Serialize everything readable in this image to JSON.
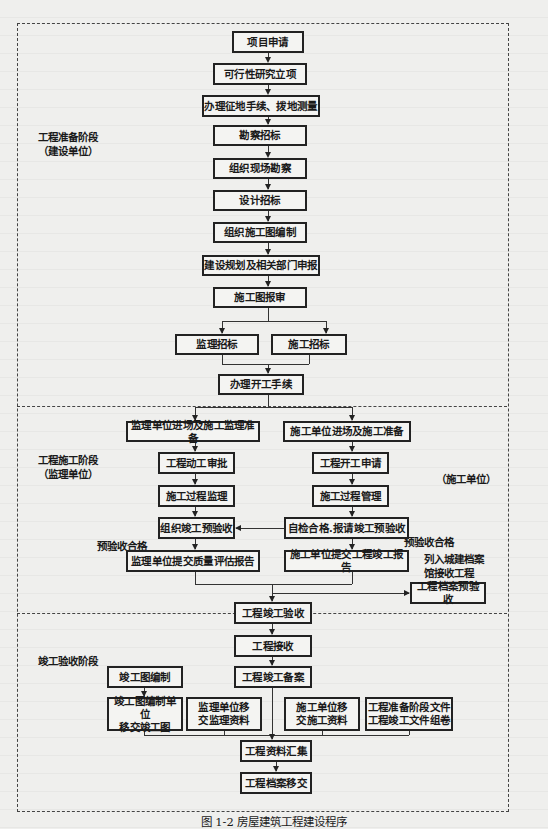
{
  "caption": "图 1-2   房屋建筑工程建设程序",
  "stages": {
    "prep": {
      "label": "工程准备阶段\n（建设单位）"
    },
    "construction": {
      "label": "工程施工阶段\n（监理单位）",
      "right_label": "（施工单位）"
    },
    "acceptance": {
      "label": "竣工验收阶段"
    }
  },
  "annotations": {
    "pre_accept_left": "预验收合格",
    "pre_accept_right": "预验收合格",
    "archive_note": "列入城建档案\n馆接收工程"
  },
  "nodes": {
    "n1": "项目申请",
    "n2": "可行性研究立项",
    "n3": "办理征地手续、拨地测量",
    "n4": "勘察招标",
    "n5": "组织现场勘察",
    "n6": "设计招标",
    "n7": "组织施工图编制",
    "n8": "建设规划及相关部门申报",
    "n9": "施工图报审",
    "n10": "监理招标",
    "n11": "施工招标",
    "n12": "办理开工手续",
    "s1": "监理单位进场及施工监理准备",
    "s2": "工程动工审批",
    "s3": "施工过程监理",
    "s4": "组织竣工预验收",
    "s5": "监理单位提交质量评估报告",
    "c1": "施工单位进场及施工准备",
    "c2": "工程开工申请",
    "c3": "施工过程管理",
    "c4": "自检合格.报请竣工预验收",
    "c5": "施工单位提交工程竣工报告",
    "a0": "工程档案预验收",
    "a1": "工程竣工验收",
    "a2": "工程接收",
    "a3": "工程竣工备案",
    "d1": "竣工图编制",
    "d2": "竣工图编制单位\n移交竣工图",
    "d3": "监理单位移\n交监理资料",
    "d4": "施工单位移\n交施工资料",
    "d5": "工程准备阶段文件\n工程竣工文件组卷",
    "f1": "工程资料汇集",
    "f2": "工程档案移交"
  }
}
